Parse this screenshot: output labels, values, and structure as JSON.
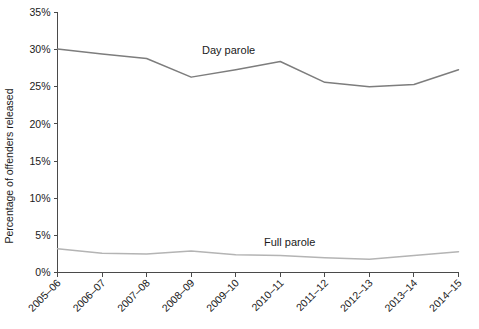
{
  "chart_data": {
    "type": "line",
    "title": "",
    "xlabel": "",
    "ylabel": "Percentage of offenders released",
    "ylim": [
      0,
      35
    ],
    "ytick_labels": [
      "0%",
      "5%",
      "10%",
      "15%",
      "20%",
      "25%",
      "30%",
      "35%"
    ],
    "ytick_values": [
      0,
      5,
      10,
      15,
      20,
      25,
      30,
      35
    ],
    "grid": false,
    "legend_position": "inline-annotation",
    "categories": [
      "2005–06",
      "2006–07",
      "2007–08",
      "2008–09",
      "2009–10",
      "2010–11",
      "2011–12",
      "2012–13",
      "2013–14",
      "2014–15"
    ],
    "series": [
      {
        "name": "Day parole",
        "color": "#7d7d7d",
        "values": [
          30.1,
          29.4,
          28.8,
          26.3,
          27.3,
          28.4,
          25.6,
          25.0,
          25.3,
          27.3
        ]
      },
      {
        "name": "Full parole",
        "color": "#b4b4b4",
        "values": [
          3.2,
          2.6,
          2.5,
          2.9,
          2.4,
          2.3,
          2.0,
          1.8,
          2.3,
          2.8
        ]
      }
    ],
    "annotations": [
      {
        "text": "Day parole",
        "x_px": 202,
        "y_px": 54
      },
      {
        "text": "Full parole",
        "x_px": 264,
        "y_px": 246
      }
    ]
  }
}
